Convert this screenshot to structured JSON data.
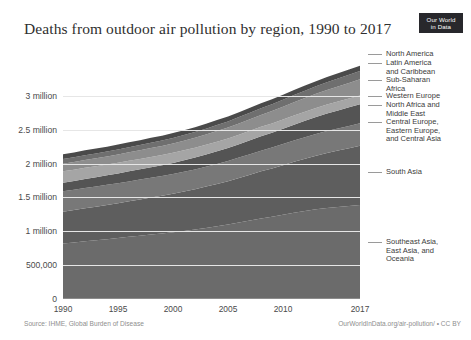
{
  "header": {
    "title": "Deaths from outdoor air pollution by region, 1990 to 2017",
    "logo_line1": "Our World",
    "logo_line2": "in Data"
  },
  "footer": {
    "source": "Source: IHME, Global Burden of Disease",
    "attribution": "OurWorldInData.org/air-pollution/ • CC BY"
  },
  "chart_data": {
    "type": "area",
    "title": "Deaths from outdoor air pollution by region, 1990 to 2017",
    "xlabel": "",
    "ylabel": "",
    "stacked": true,
    "grid": true,
    "legend_position": "right",
    "xlim": [
      1990,
      2017
    ],
    "ylim": [
      0,
      3500000
    ],
    "x": [
      1990,
      1991,
      1992,
      1993,
      1994,
      1995,
      1996,
      1997,
      1998,
      1999,
      2000,
      2001,
      2002,
      2003,
      2004,
      2005,
      2006,
      2007,
      2008,
      2009,
      2010,
      2011,
      2012,
      2013,
      2014,
      2015,
      2016,
      2017
    ],
    "xticks": [
      1990,
      1995,
      2000,
      2005,
      2010,
      2017
    ],
    "xtick_labels": [
      "1990",
      "1995",
      "2000",
      "2005",
      "2010",
      "2017"
    ],
    "yticks": [
      0,
      500000,
      1000000,
      1500000,
      2000000,
      2500000,
      3000000
    ],
    "ytick_labels": [
      "0",
      "500,000",
      "1 million",
      "1.5 million",
      "2 million",
      "2.5 million",
      "3 million"
    ],
    "series": [
      {
        "name": "Southeast Asia, East Asia, and Oceania",
        "color": "#6b6b6b",
        "values": [
          820000,
          835000,
          852000,
          868000,
          884000,
          900000,
          918000,
          935000,
          952000,
          968000,
          985000,
          1005000,
          1025000,
          1050000,
          1075000,
          1100000,
          1130000,
          1160000,
          1190000,
          1215000,
          1245000,
          1275000,
          1300000,
          1325000,
          1345000,
          1360000,
          1375000,
          1390000
        ]
      },
      {
        "name": "South Asia",
        "color": "#5e5e5e",
        "values": [
          470000,
          478000,
          487000,
          496000,
          505000,
          515000,
          525000,
          536000,
          547000,
          558000,
          570000,
          583000,
          596000,
          610000,
          625000,
          640000,
          658000,
          676000,
          695000,
          713000,
          732000,
          752000,
          772000,
          792000,
          812000,
          832000,
          852000,
          872000
        ]
      },
      {
        "name": "Central Europe, Eastern Europe, and Central Asia",
        "color": "#787878",
        "values": [
          300000,
          300000,
          300000,
          298000,
          297000,
          295000,
          294000,
          292000,
          291000,
          290000,
          290000,
          291000,
          292000,
          293000,
          295000,
          297000,
          300000,
          303000,
          306000,
          308000,
          311000,
          314000,
          317000,
          320000,
          323000,
          326000,
          329000,
          332000
        ]
      },
      {
        "name": "North Africa and Middle East",
        "color": "#545454",
        "values": [
          128000,
          131000,
          134000,
          137000,
          140000,
          144000,
          148000,
          152000,
          156000,
          160000,
          165000,
          170000,
          175000,
          180000,
          186000,
          192000,
          198000,
          205000,
          212000,
          219000,
          226000,
          234000,
          242000,
          250000,
          258000,
          266000,
          274000,
          282000
        ]
      },
      {
        "name": "Western Europe",
        "color": "#a5a5a5",
        "values": [
          168000,
          166000,
          164000,
          162000,
          160000,
          158000,
          156000,
          154000,
          152000,
          150000,
          148000,
          146000,
          145000,
          144000,
          143000,
          142000,
          141000,
          140000,
          139000,
          138000,
          137000,
          136000,
          135000,
          134000,
          133000,
          132000,
          131000,
          130000
        ]
      },
      {
        "name": "Sub-Saharan Africa",
        "color": "#8d8d8d",
        "values": [
          112000,
          114000,
          116000,
          118000,
          120000,
          123000,
          126000,
          129000,
          132000,
          135000,
          139000,
          143000,
          147000,
          151000,
          156000,
          161000,
          166000,
          171000,
          177000,
          183000,
          189000,
          195000,
          202000,
          209000,
          216000,
          223000,
          230000,
          238000
        ]
      },
      {
        "name": "Latin America and Caribbean",
        "color": "#6f6f6f",
        "values": [
          68000,
          69000,
          70000,
          71000,
          72000,
          73000,
          75000,
          76000,
          78000,
          79000,
          81000,
          83000,
          85000,
          87000,
          89000,
          91000,
          93000,
          95000,
          98000,
          100000,
          103000,
          105000,
          108000,
          111000,
          114000,
          117000,
          120000,
          123000
        ]
      },
      {
        "name": "North America",
        "color": "#4a4a4a",
        "values": [
          72000,
          72000,
          72000,
          72000,
          72000,
          72000,
          72000,
          72000,
          72000,
          72000,
          72000,
          72000,
          73000,
          73000,
          73000,
          73000,
          73000,
          74000,
          74000,
          74000,
          75000,
          75000,
          76000,
          76000,
          77000,
          77000,
          78000,
          78000
        ]
      }
    ],
    "legend_labels": [
      "North America",
      "Latin America\nand Caribbean",
      "Sub-Saharan\nAfrica",
      "Western Europe",
      "North Africa and\nMiddle East",
      "Central Europe,\nEastern Europe,\nand Central Asia",
      "South Asia",
      "Southeast Asia,\nEast Asia, and\nOceania"
    ]
  }
}
